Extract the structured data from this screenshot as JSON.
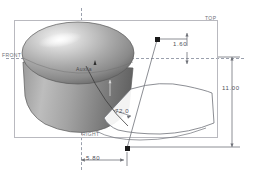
{
  "viewport": {
    "background": "#ffffff",
    "frame_color": "#b9b9bf"
  },
  "datum_planes": {
    "top": "TOP",
    "front": "FRONT",
    "right": "RIGHT",
    "auxiliary": "Auxila"
  },
  "dimensions": [
    {
      "id": "width-offset",
      "value": "1.60"
    },
    {
      "id": "height",
      "value": "11.00"
    },
    {
      "id": "base-offset",
      "value": "5.80"
    },
    {
      "id": "angle",
      "value": "72.0"
    }
  ],
  "dimension_values": {
    "offset_top": "1.60",
    "height_total": "11.00",
    "offset_base": "5.80",
    "angle_deg": "72.0"
  },
  "model": {
    "name": "revolved-solid",
    "shading": {
      "highlight": "#f2f2f2",
      "midtone": "#a8a8a8",
      "shadow": "#6a6a6a",
      "outline": "#4d4d4d"
    }
  },
  "handles": [
    {
      "id": "upper-handle",
      "color": "#1a1a1a"
    },
    {
      "id": "lower-handle",
      "color": "#1a1a1a"
    }
  ],
  "profile_curve": {
    "stroke": "#6f7178",
    "fill": "#ffffff"
  }
}
